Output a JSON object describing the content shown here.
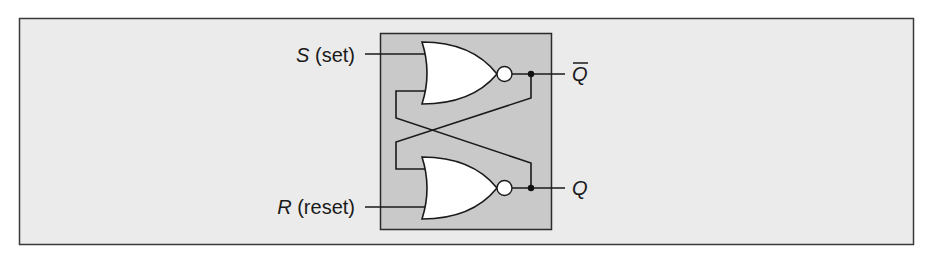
{
  "figure": {
    "colors": {
      "page_background": "#ffffff",
      "panel_background": "#ebebeb",
      "panel_border": "#3a3a3a",
      "circuit_box_fill": "#c9c9c9",
      "circuit_box_border": "#2a2a2a",
      "gate_fill": "#ffffff",
      "wire": "#1a1a1a"
    },
    "inputs": {
      "set": {
        "letter": "S",
        "suffix": " (set)"
      },
      "reset": {
        "letter": "R",
        "suffix": " (reset)"
      }
    },
    "outputs": {
      "q_bar": {
        "letter": "Q",
        "overbar": true
      },
      "q": {
        "letter": "Q",
        "overbar": false
      }
    },
    "gates": [
      {
        "id": "gate-top",
        "type": "NOR"
      },
      {
        "id": "gate-bottom",
        "type": "NOR"
      }
    ]
  }
}
